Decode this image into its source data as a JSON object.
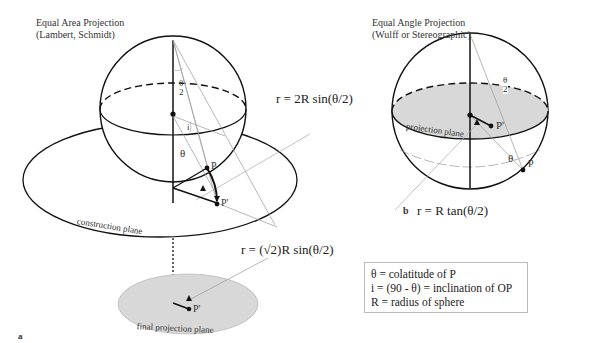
{
  "figure_a": {
    "title_line1": "Equal Area Projection",
    "title_line2": "(Lambert, Schmidt)",
    "formula_main": "r = 2R sin(θ/2)",
    "formula_final": "r = (√2)R sin(θ/2)",
    "construction_plane_label": "construction plane",
    "final_plane_label": "final projection plane",
    "angle_half_num": "θ",
    "angle_half_den": "2",
    "angle_i": "i",
    "angle_theta": "θ",
    "point_P": "P",
    "point_P_prime": "P'",
    "point_P_prime_final": "P'",
    "panel_letter": "a"
  },
  "figure_b": {
    "title_line1": "Equal Angle Projection",
    "title_line2": "(Wulff or Stereographic)",
    "formula": "r = R tan(θ/2)",
    "projection_plane_label": "projection plane",
    "angle_half_num": "θ",
    "angle_half_den": "2",
    "angle_theta": "θ",
    "point_P": "P",
    "point_P_prime": "P'",
    "panel_letter": "b"
  },
  "legend": {
    "line1": "θ  = colatitude of P",
    "line2": "i  = (90 - θ)  =  inclination of OP",
    "line3": "R = radius of sphere"
  },
  "colors": {
    "plane_fill": "#d8d8d8",
    "line_dark": "#111111",
    "line_light": "#aaaaaa"
  }
}
